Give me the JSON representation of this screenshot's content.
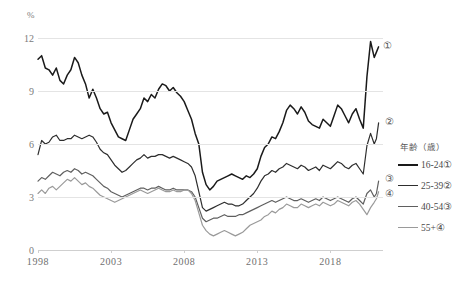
{
  "chart_data": {
    "type": "line",
    "title": "",
    "subtitle": "",
    "xlabel": "",
    "ylabel": "%",
    "unit_label": "%",
    "xlim": [
      1998.0,
      2021.6
    ],
    "ylim": [
      0,
      12
    ],
    "yticks": [
      0,
      3,
      6,
      9,
      12
    ],
    "xticks": [
      1998,
      2003,
      2008,
      2013,
      2018
    ],
    "xtick_labels": [
      "1998",
      "2003",
      "2008",
      "2013",
      "2018"
    ],
    "ytick_labels": [
      "0",
      "3",
      "6",
      "9",
      "12"
    ],
    "grid": true,
    "grid_axis": "y",
    "legend_position": "right",
    "legend_title": "年齢（歳）",
    "annotations": [
      {
        "text": "①",
        "series": "16-24①",
        "x": 2021.35,
        "y": 11.6
      },
      {
        "text": "②",
        "series": "25-39②",
        "x": 2021.45,
        "y": 7.3
      },
      {
        "text": "③",
        "series": "40-54③",
        "x": 2021.45,
        "y": 4.05
      },
      {
        "text": "④",
        "series": "55+④",
        "x": 2021.45,
        "y": 3.25
      }
    ],
    "series": [
      {
        "name": "16-24①",
        "marker_label": "①",
        "color": "#1a1a1a",
        "width": 1.5,
        "x": [
          1998.0,
          1998.25,
          1998.5,
          1998.75,
          1999.0,
          1999.25,
          1999.5,
          1999.75,
          2000.0,
          2000.25,
          2000.5,
          2000.75,
          2001.0,
          2001.25,
          2001.5,
          2001.75,
          2002.0,
          2002.25,
          2002.5,
          2002.75,
          2003.0,
          2003.25,
          2003.5,
          2003.75,
          2004.0,
          2004.25,
          2004.5,
          2004.75,
          2005.0,
          2005.25,
          2005.5,
          2005.75,
          2006.0,
          2006.25,
          2006.5,
          2006.75,
          2007.0,
          2007.25,
          2007.5,
          2007.75,
          2008.0,
          2008.25,
          2008.5,
          2008.75,
          2009.0,
          2009.25,
          2009.5,
          2009.75,
          2010.0,
          2010.25,
          2010.5,
          2010.75,
          2011.0,
          2011.25,
          2011.5,
          2011.75,
          2012.0,
          2012.25,
          2012.5,
          2012.75,
          2013.0,
          2013.25,
          2013.5,
          2013.75,
          2014.0,
          2014.25,
          2014.5,
          2014.75,
          2015.0,
          2015.25,
          2015.5,
          2015.75,
          2016.0,
          2016.25,
          2016.5,
          2016.75,
          2017.0,
          2017.25,
          2017.5,
          2017.75,
          2018.0,
          2018.25,
          2018.5,
          2018.75,
          2019.0,
          2019.25,
          2019.5,
          2019.75,
          2020.0,
          2020.25,
          2020.5,
          2020.75,
          2021.0,
          2021.15,
          2021.3
        ],
        "y": [
          10.8,
          11.0,
          10.3,
          10.2,
          9.9,
          10.3,
          9.6,
          9.4,
          9.9,
          10.2,
          10.9,
          10.6,
          9.9,
          9.4,
          8.6,
          9.1,
          8.6,
          8.0,
          7.7,
          7.8,
          7.2,
          6.8,
          6.4,
          6.3,
          6.2,
          6.8,
          7.4,
          7.7,
          8.0,
          8.6,
          8.4,
          8.8,
          8.6,
          9.1,
          9.4,
          9.3,
          9.0,
          9.2,
          8.9,
          8.7,
          8.4,
          7.9,
          7.4,
          6.6,
          6.0,
          4.4,
          3.7,
          3.4,
          3.6,
          3.9,
          4.0,
          4.1,
          4.2,
          4.3,
          4.2,
          4.1,
          4.0,
          4.2,
          4.1,
          4.3,
          4.6,
          5.3,
          5.8,
          6.0,
          6.4,
          6.3,
          6.7,
          7.2,
          7.9,
          8.2,
          8.0,
          7.7,
          8.1,
          7.8,
          7.3,
          7.1,
          7.0,
          6.9,
          7.4,
          7.2,
          7.0,
          7.6,
          8.2,
          8.0,
          7.6,
          7.2,
          7.7,
          8.0,
          7.4,
          6.9,
          9.8,
          11.8,
          10.9,
          11.2,
          11.5
        ]
      },
      {
        "name": "25-39②",
        "marker_label": "②",
        "color": "#2e2e2e",
        "width": 1.2,
        "x": [
          1998.0,
          1998.25,
          1998.5,
          1998.75,
          1999.0,
          1999.25,
          1999.5,
          1999.75,
          2000.0,
          2000.25,
          2000.5,
          2000.75,
          2001.0,
          2001.25,
          2001.5,
          2001.75,
          2002.0,
          2002.25,
          2002.5,
          2002.75,
          2003.0,
          2003.25,
          2003.5,
          2003.75,
          2004.0,
          2004.25,
          2004.5,
          2004.75,
          2005.0,
          2005.25,
          2005.5,
          2005.75,
          2006.0,
          2006.25,
          2006.5,
          2006.75,
          2007.0,
          2007.25,
          2007.5,
          2007.75,
          2008.0,
          2008.25,
          2008.5,
          2008.75,
          2009.0,
          2009.25,
          2009.5,
          2009.75,
          2010.0,
          2010.25,
          2010.5,
          2010.75,
          2011.0,
          2011.25,
          2011.5,
          2011.75,
          2012.0,
          2012.25,
          2012.5,
          2012.75,
          2013.0,
          2013.25,
          2013.5,
          2013.75,
          2014.0,
          2014.25,
          2014.5,
          2014.75,
          2015.0,
          2015.25,
          2015.5,
          2015.75,
          2016.0,
          2016.25,
          2016.5,
          2016.75,
          2017.0,
          2017.25,
          2017.5,
          2017.75,
          2018.0,
          2018.25,
          2018.5,
          2018.75,
          2019.0,
          2019.25,
          2019.5,
          2019.75,
          2020.0,
          2020.25,
          2020.5,
          2020.75,
          2021.0,
          2021.15,
          2021.3
        ],
        "y": [
          5.4,
          6.2,
          6.0,
          6.1,
          6.4,
          6.5,
          6.2,
          6.2,
          6.3,
          6.3,
          6.5,
          6.4,
          6.3,
          6.4,
          6.5,
          6.4,
          6.1,
          5.7,
          5.5,
          5.4,
          5.1,
          4.8,
          4.6,
          4.4,
          4.5,
          4.7,
          4.9,
          5.1,
          5.2,
          5.4,
          5.2,
          5.3,
          5.3,
          5.4,
          5.4,
          5.3,
          5.2,
          5.3,
          5.2,
          5.1,
          5.0,
          4.9,
          4.7,
          4.2,
          3.3,
          2.4,
          2.2,
          2.3,
          2.4,
          2.5,
          2.6,
          2.7,
          2.6,
          2.6,
          2.5,
          2.5,
          2.6,
          2.8,
          3.0,
          3.2,
          3.5,
          3.9,
          4.2,
          4.3,
          4.5,
          4.4,
          4.6,
          4.7,
          4.9,
          4.8,
          4.7,
          4.6,
          4.8,
          4.7,
          4.5,
          4.6,
          4.7,
          4.5,
          4.8,
          4.7,
          4.6,
          4.8,
          5.0,
          4.9,
          4.7,
          4.6,
          4.8,
          4.9,
          4.6,
          4.3,
          5.9,
          6.6,
          6.0,
          6.3,
          7.2
        ]
      },
      {
        "name": "40-54③",
        "marker_label": "③",
        "color": "#5f5f5f",
        "width": 1.2,
        "x": [
          1998.0,
          1998.25,
          1998.5,
          1998.75,
          1999.0,
          1999.25,
          1999.5,
          1999.75,
          2000.0,
          2000.25,
          2000.5,
          2000.75,
          2001.0,
          2001.25,
          2001.5,
          2001.75,
          2002.0,
          2002.25,
          2002.5,
          2002.75,
          2003.0,
          2003.25,
          2003.5,
          2003.75,
          2004.0,
          2004.25,
          2004.5,
          2004.75,
          2005.0,
          2005.25,
          2005.5,
          2005.75,
          2006.0,
          2006.25,
          2006.5,
          2006.75,
          2007.0,
          2007.25,
          2007.5,
          2007.75,
          2008.0,
          2008.25,
          2008.5,
          2008.75,
          2009.0,
          2009.25,
          2009.5,
          2009.75,
          2010.0,
          2010.25,
          2010.5,
          2010.75,
          2011.0,
          2011.25,
          2011.5,
          2011.75,
          2012.0,
          2012.25,
          2012.5,
          2012.75,
          2013.0,
          2013.25,
          2013.5,
          2013.75,
          2014.0,
          2014.25,
          2014.5,
          2014.75,
          2015.0,
          2015.25,
          2015.5,
          2015.75,
          2016.0,
          2016.25,
          2016.5,
          2016.75,
          2017.0,
          2017.25,
          2017.5,
          2017.75,
          2018.0,
          2018.25,
          2018.5,
          2018.75,
          2019.0,
          2019.25,
          2019.5,
          2019.75,
          2020.0,
          2020.25,
          2020.5,
          2020.75,
          2021.0,
          2021.15,
          2021.3
        ],
        "y": [
          3.9,
          4.1,
          4.0,
          4.2,
          4.4,
          4.3,
          4.2,
          4.4,
          4.5,
          4.4,
          4.6,
          4.5,
          4.3,
          4.4,
          4.3,
          4.2,
          4.0,
          3.8,
          3.6,
          3.5,
          3.3,
          3.2,
          3.1,
          3.0,
          3.1,
          3.2,
          3.3,
          3.4,
          3.5,
          3.5,
          3.4,
          3.5,
          3.5,
          3.6,
          3.5,
          3.4,
          3.4,
          3.5,
          3.4,
          3.4,
          3.4,
          3.4,
          3.3,
          3.0,
          2.4,
          1.8,
          1.6,
          1.7,
          1.8,
          1.8,
          1.9,
          2.0,
          1.9,
          1.9,
          1.9,
          2.0,
          2.0,
          2.1,
          2.2,
          2.3,
          2.4,
          2.5,
          2.6,
          2.7,
          2.8,
          2.7,
          2.8,
          2.9,
          3.0,
          2.9,
          2.8,
          2.8,
          2.9,
          2.8,
          2.7,
          2.8,
          2.9,
          2.8,
          3.0,
          2.9,
          2.8,
          2.9,
          3.0,
          2.9,
          2.8,
          2.7,
          2.9,
          3.0,
          2.8,
          2.6,
          3.2,
          3.4,
          3.0,
          3.2,
          3.9
        ]
      },
      {
        "name": "55+④",
        "marker_label": "④",
        "color": "#9a9a9a",
        "width": 1.2,
        "x": [
          1998.0,
          1998.25,
          1998.5,
          1998.75,
          1999.0,
          1999.25,
          1999.5,
          1999.75,
          2000.0,
          2000.25,
          2000.5,
          2000.75,
          2001.0,
          2001.25,
          2001.5,
          2001.75,
          2002.0,
          2002.25,
          2002.5,
          2002.75,
          2003.0,
          2003.25,
          2003.5,
          2003.75,
          2004.0,
          2004.25,
          2004.5,
          2004.75,
          2005.0,
          2005.25,
          2005.5,
          2005.75,
          2006.0,
          2006.25,
          2006.5,
          2006.75,
          2007.0,
          2007.25,
          2007.5,
          2007.75,
          2008.0,
          2008.25,
          2008.5,
          2008.75,
          2009.0,
          2009.25,
          2009.5,
          2009.75,
          2010.0,
          2010.25,
          2010.5,
          2010.75,
          2011.0,
          2011.25,
          2011.5,
          2011.75,
          2012.0,
          2012.25,
          2012.5,
          2012.75,
          2013.0,
          2013.25,
          2013.5,
          2013.75,
          2014.0,
          2014.25,
          2014.5,
          2014.75,
          2015.0,
          2015.25,
          2015.5,
          2015.75,
          2016.0,
          2016.25,
          2016.5,
          2016.75,
          2017.0,
          2017.25,
          2017.5,
          2017.75,
          2018.0,
          2018.25,
          2018.5,
          2018.75,
          2019.0,
          2019.25,
          2019.5,
          2019.75,
          2020.0,
          2020.25,
          2020.5,
          2020.75,
          2021.0,
          2021.15,
          2021.3
        ],
        "y": [
          3.2,
          3.4,
          3.2,
          3.5,
          3.6,
          3.4,
          3.6,
          3.8,
          4.0,
          3.9,
          4.1,
          3.9,
          3.7,
          3.8,
          3.6,
          3.5,
          3.3,
          3.1,
          3.0,
          2.9,
          2.8,
          2.7,
          2.8,
          2.9,
          3.0,
          3.1,
          3.2,
          3.3,
          3.4,
          3.3,
          3.2,
          3.3,
          3.4,
          3.5,
          3.4,
          3.3,
          3.3,
          3.4,
          3.3,
          3.3,
          3.4,
          3.4,
          3.2,
          2.8,
          2.1,
          1.4,
          1.1,
          0.9,
          0.8,
          0.9,
          1.0,
          1.1,
          1.0,
          0.9,
          0.8,
          0.9,
          1.0,
          1.2,
          1.4,
          1.5,
          1.6,
          1.7,
          1.9,
          2.0,
          2.2,
          2.1,
          2.3,
          2.4,
          2.6,
          2.5,
          2.4,
          2.4,
          2.6,
          2.5,
          2.4,
          2.5,
          2.6,
          2.5,
          2.7,
          2.6,
          2.5,
          2.6,
          2.8,
          2.7,
          2.6,
          2.5,
          2.7,
          2.8,
          2.6,
          2.3,
          2.0,
          2.4,
          2.7,
          2.9,
          3.3
        ]
      }
    ]
  },
  "legend": {
    "title": "年齢（歳）",
    "items": [
      {
        "label": "16-24①",
        "color": "#1a1a1a",
        "width": 2.6
      },
      {
        "label": "25-39②",
        "color": "#2e2e2e",
        "width": 1.8
      },
      {
        "label": "40-54③",
        "color": "#5f5f5f",
        "width": 1.6
      },
      {
        "label": "55+④",
        "color": "#9a9a9a",
        "width": 1.6
      }
    ]
  }
}
